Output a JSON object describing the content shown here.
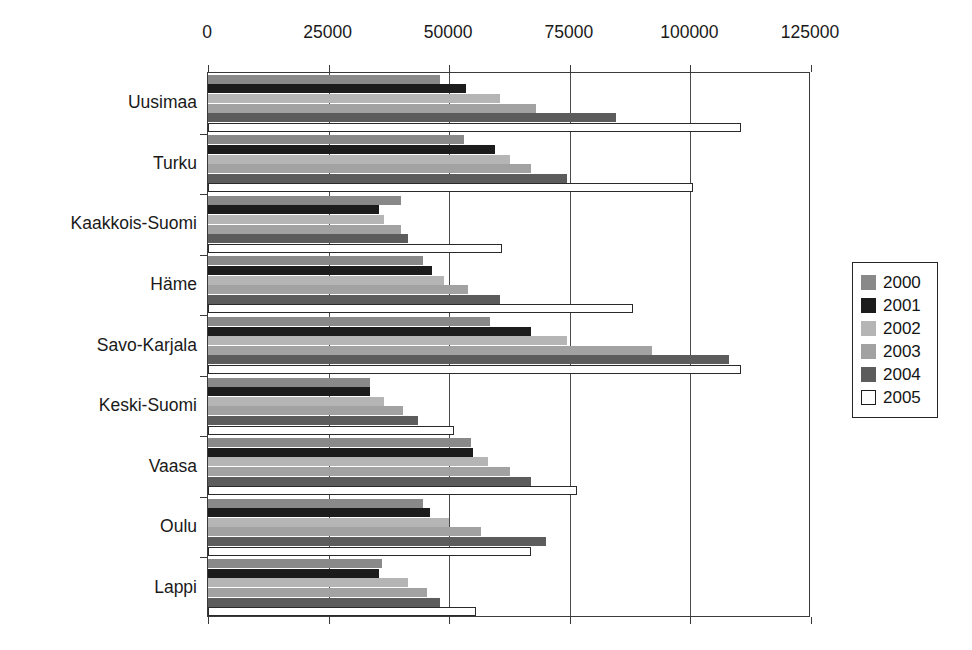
{
  "chart_data": {
    "type": "bar",
    "orientation": "horizontal",
    "title": "",
    "subtitle": "",
    "xlabel": "",
    "ylabel": "",
    "xlim": [
      0,
      125000
    ],
    "xticks": [
      0,
      25000,
      50000,
      75000,
      100000,
      125000
    ],
    "xtick_labels": [
      "0",
      "25000",
      "50000",
      "75000",
      "100000",
      "125000"
    ],
    "grid": true,
    "grid_axis": "x",
    "legend_position": "right",
    "categories": [
      "Uusimaa",
      "Turku",
      "Kaakkois-Suomi",
      "Häme",
      "Savo-Karjala",
      "Keski-Suomi",
      "Vaasa",
      "Oulu",
      "Lappi"
    ],
    "series": [
      {
        "name": "2000",
        "color": "#898989",
        "values": [
          48000,
          53000,
          40000,
          44500,
          58500,
          33500,
          54500,
          44500,
          36000
        ]
      },
      {
        "name": "2001",
        "color": "#1c1c1c",
        "values": [
          53500,
          59500,
          35500,
          46500,
          67000,
          33500,
          55000,
          46000,
          35500
        ]
      },
      {
        "name": "2002",
        "color": "#b5b5b5",
        "values": [
          60500,
          62500,
          36500,
          49000,
          74500,
          36500,
          58000,
          50000,
          41500
        ]
      },
      {
        "name": "2003",
        "color": "#a2a2a2",
        "values": [
          68000,
          67000,
          40000,
          54000,
          92000,
          40500,
          62500,
          56500,
          45500
        ]
      },
      {
        "name": "2004",
        "color": "#5c5c5c",
        "values": [
          84500,
          74500,
          41500,
          60500,
          108000,
          43500,
          67000,
          70000,
          48000
        ]
      },
      {
        "name": "2005",
        "color": "#ffffff",
        "values": [
          110500,
          100500,
          61000,
          88000,
          110500,
          51000,
          76500,
          67000,
          55500
        ]
      }
    ]
  },
  "legend": {
    "entries": [
      {
        "label": "2000",
        "swatch": "s2000"
      },
      {
        "label": "2001",
        "swatch": "s2001"
      },
      {
        "label": "2002",
        "swatch": "s2002"
      },
      {
        "label": "2003",
        "swatch": "s2003"
      },
      {
        "label": "2004",
        "swatch": "s2004"
      },
      {
        "label": "2005",
        "swatch": "s2005"
      }
    ]
  },
  "colors": {
    "axis": "#3a3a3a",
    "grid": "#4a4a4a",
    "text": "#141414",
    "background": "#ffffff"
  }
}
